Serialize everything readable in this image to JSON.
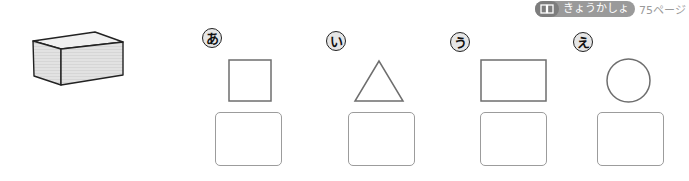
{
  "header": {
    "badge_icon": "book-icon",
    "badge_label": "きょうかしょ",
    "page_ref": "75ページ"
  },
  "reference_solid": {
    "type": "rectangular-prism",
    "icon": "box-icon"
  },
  "items": [
    {
      "marker": "あ",
      "shape": "square"
    },
    {
      "marker": "い",
      "shape": "triangle"
    },
    {
      "marker": "う",
      "shape": "rectangle"
    },
    {
      "marker": "え",
      "shape": "circle"
    }
  ],
  "colors": {
    "badge_bg": "#9a9a9a",
    "badge_icon_bg": "#7d7d7d",
    "shape_stroke": "#6e6e6e",
    "answer_box_stroke": "#9c9c9c",
    "solid_fill": "#dcdcdc"
  }
}
